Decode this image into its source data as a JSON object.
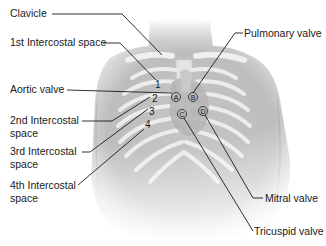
{
  "diagram": {
    "labels_left": [
      {
        "id": "clavicle",
        "text": "Clavicle"
      },
      {
        "id": "ic1",
        "text": "1st Intercostal space"
      },
      {
        "id": "aortic",
        "text": "Aortic valve"
      },
      {
        "id": "ic2_l1",
        "text": "2nd Intercostal"
      },
      {
        "id": "ic2_l2",
        "text": "space"
      },
      {
        "id": "ic3_l1",
        "text": "3rd Intercostal"
      },
      {
        "id": "ic3_l2",
        "text": "space"
      },
      {
        "id": "ic4_l1",
        "text": "4th Intercostal"
      },
      {
        "id": "ic4_l2",
        "text": "space"
      }
    ],
    "labels_right": [
      {
        "id": "pulmonary",
        "text": "Pulmonary valve"
      },
      {
        "id": "mitral",
        "text": "Mitral valve"
      },
      {
        "id": "tricuspid",
        "text": "Tricuspid valve"
      }
    ],
    "rib_numbers": [
      "1",
      "2",
      "3",
      "4"
    ],
    "valve_markers": [
      "A",
      "B",
      "C",
      "D"
    ],
    "colors": {
      "skin": "#d4d4d4",
      "skin_dark": "#a8a8a8",
      "bone": "#eeeeee",
      "leader_line": "#1a1a1a",
      "text": "#1a1a1a"
    }
  }
}
